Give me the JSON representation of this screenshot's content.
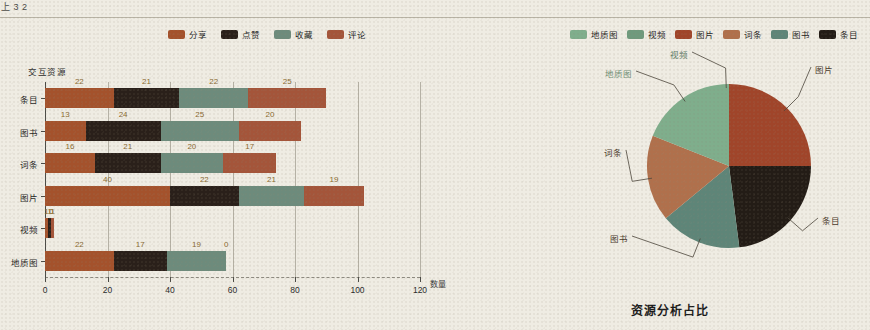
{
  "page": {
    "top_fragment": "上 3 2",
    "background_color": "#efece3"
  },
  "bar_chart": {
    "legend": [
      {
        "label": "分享",
        "color": "#a4522c"
      },
      {
        "label": "点赞",
        "color": "#2a201a"
      },
      {
        "label": "收藏",
        "color": "#6d8b7c"
      },
      {
        "label": "评论",
        "color": "#a4553a"
      }
    ],
    "y_axis_title": "交互资源",
    "x_axis_title": "数量",
    "x_ticks": [
      "0",
      "20",
      "40",
      "60",
      "80",
      "100",
      "120"
    ]
  },
  "pie_chart": {
    "title": "资源分析占比",
    "legend": [
      {
        "label": "地质图",
        "color": "#7fae8c"
      },
      {
        "label": "视频",
        "color": "#6f9a7d"
      },
      {
        "label": "图片",
        "color": "#a0452a"
      },
      {
        "label": "词条",
        "color": "#b0704c"
      },
      {
        "label": "图书",
        "color": "#5e8578"
      },
      {
        "label": "条目",
        "color": "#231c16"
      }
    ],
    "callouts": [
      {
        "label": "图片",
        "color": "#4a3a2c"
      },
      {
        "label": "条目",
        "color": "#4a3a2c"
      },
      {
        "label": "图书",
        "color": "#4a3a2c"
      },
      {
        "label": "词条",
        "color": "#4a3a2c"
      },
      {
        "label": "地质图",
        "color": "#6f8f76"
      },
      {
        "label": "视频",
        "color": "#5e7a66"
      }
    ]
  },
  "chart_data": [
    {
      "type": "bar",
      "orientation": "horizontal",
      "stacked": true,
      "title": "",
      "xlabel": "数量",
      "ylabel": "交互资源",
      "xlim": [
        0,
        120
      ],
      "grid": true,
      "legend_position": "top",
      "categories": [
        "条目",
        "图书",
        "词条",
        "图片",
        "视频",
        "地质图"
      ],
      "series": [
        {
          "name": "分享",
          "color": "#a4522c",
          "values": [
            22,
            13,
            16,
            40,
            1,
            22
          ]
        },
        {
          "name": "点赞",
          "color": "#2a201a",
          "values": [
            21,
            24,
            21,
            22,
            1,
            17
          ]
        },
        {
          "name": "收藏",
          "color": "#6d8b7c",
          "values": [
            22,
            25,
            20,
            21,
            0,
            19
          ]
        },
        {
          "name": "评论",
          "color": "#a4553a",
          "values": [
            25,
            20,
            17,
            19,
            1,
            0
          ]
        }
      ],
      "row_totals": [
        90,
        82,
        74,
        102,
        3,
        58
      ]
    },
    {
      "type": "pie",
      "title": "资源分析占比",
      "legend_position": "top",
      "labels": [
        "图片",
        "条目",
        "图书",
        "词条",
        "地质图",
        "视频"
      ],
      "values": [
        25,
        23,
        16,
        17,
        19,
        0
      ],
      "colors": [
        "#a0452a",
        "#231c16",
        "#5e8578",
        "#b0704c",
        "#7fae8c",
        "#6f9a7d"
      ]
    }
  ]
}
